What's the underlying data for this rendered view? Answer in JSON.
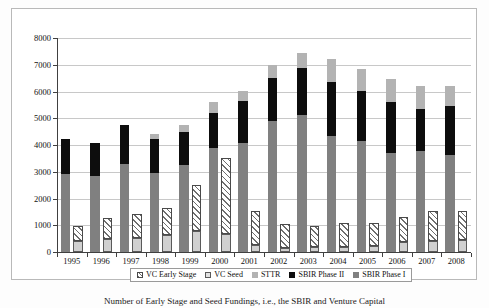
{
  "figure": {
    "caption": "Number of Early Stage and Seed Fundings, i.e., the SBIR and Venture Capital"
  },
  "legend": {
    "position": "bottom-center",
    "items": [
      {
        "label": "VC Early Stage",
        "swatch": "vc-early-stage-swatch",
        "color": "#ffffff",
        "pattern": "diagonal-hatch"
      },
      {
        "label": "VC Seed",
        "swatch": "vc-seed-swatch",
        "color": "#d0d0d0",
        "pattern": "solid"
      },
      {
        "label": "STTR",
        "swatch": "sttr-swatch",
        "color": "#b3b3b3",
        "pattern": "solid"
      },
      {
        "label": "SBIR Phase II",
        "swatch": "sbir-phase-ii-swatch",
        "color": "#0d0d0d",
        "pattern": "solid"
      },
      {
        "label": "SBIR Phase I",
        "swatch": "sbir-phase-i-swatch",
        "color": "#808080",
        "pattern": "solid"
      }
    ]
  },
  "chart_data": {
    "type": "bar",
    "subtype": "grouped-stacked",
    "title": "",
    "subtitle": "",
    "xlabel": "",
    "ylabel": "",
    "ylim": [
      0,
      8000
    ],
    "ytick_step": 1000,
    "yticks": [
      "0",
      "1000",
      "2000",
      "3000",
      "4000",
      "5000",
      "6000",
      "7000",
      "8000"
    ],
    "grid": "horizontal",
    "categories": [
      "1995",
      "1996",
      "1997",
      "1998",
      "1999",
      "2000",
      "2001",
      "2002",
      "2003",
      "2004",
      "2005",
      "2006",
      "2007",
      "2008"
    ],
    "groups": [
      {
        "name": "SBIR",
        "position": "left",
        "series": [
          {
            "name": "SBIR Phase I",
            "color": "#808080",
            "values": [
              2930,
              2840,
              3290,
              2940,
              3250,
              3870,
              4090,
              4890,
              5110,
              4330,
              4150,
              3720,
              3760,
              3640
            ]
          },
          {
            "name": "SBIR Phase II",
            "color": "#0d0d0d",
            "values": [
              1290,
              1220,
              1450,
              1290,
              1240,
              1330,
              1560,
              1620,
              1770,
              2010,
              1880,
              1900,
              1600,
              1830
            ]
          },
          {
            "name": "STTR",
            "color": "#b3b3b3",
            "values": [
              0,
              0,
              0,
              190,
              270,
              410,
              380,
              470,
              560,
              880,
              830,
              860,
              840,
              730
            ]
          }
        ]
      },
      {
        "name": "Venture Capital",
        "position": "right",
        "series": [
          {
            "name": "VC Seed",
            "color": "#d0d0d0",
            "values": [
              410,
              490,
              530,
              650,
              790,
              680,
              270,
              160,
              190,
              180,
              230,
              360,
              430,
              440
            ]
          },
          {
            "name": "VC Early Stage",
            "color": "#ffffff",
            "values": [
              550,
              780,
              890,
              1010,
              1720,
              2850,
              1280,
              870,
              800,
              890,
              840,
              950,
              1090,
              1080
            ]
          }
        ]
      }
    ],
    "totals": {
      "sbir": [
        4220,
        4060,
        4740,
        4420,
        4760,
        5610,
        6030,
        6980,
        7440,
        7220,
        6860,
        6480,
        6200,
        6200
      ],
      "vc": [
        960,
        1270,
        1420,
        1660,
        2510,
        3530,
        1550,
        1030,
        990,
        1070,
        1070,
        1310,
        1520,
        1520
      ]
    }
  }
}
